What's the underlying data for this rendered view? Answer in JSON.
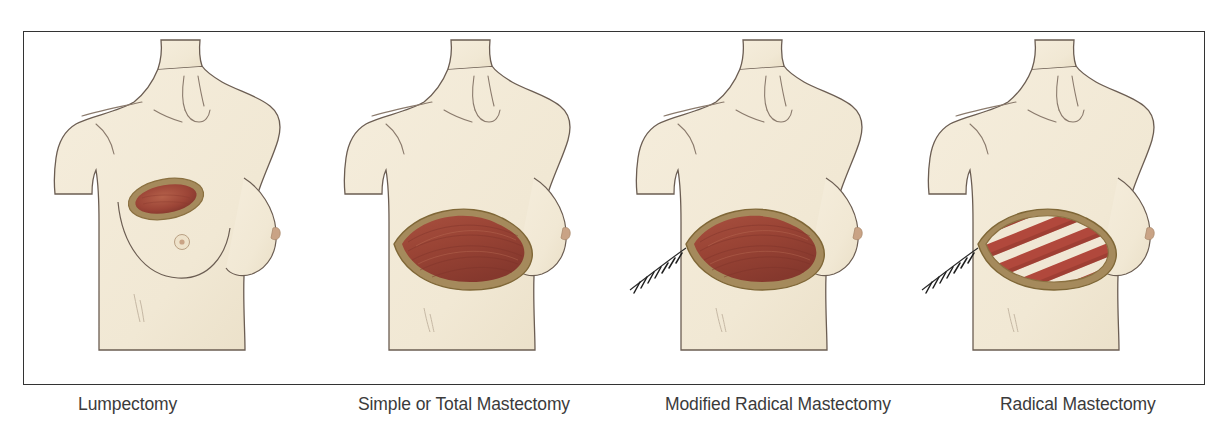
{
  "figure": {
    "border_color": "#333333",
    "background_color": "#ffffff",
    "panel_count": 4
  },
  "palette": {
    "skin_fill": "#f3ebd9",
    "skin_fill_shade": "#ece3cd",
    "outline": "#6b5d52",
    "outline_soft": "#9c8e80",
    "nipple": "#c9a385",
    "wound_rim": "#a58a5c",
    "wound_rim_dark": "#8a7040",
    "muscle_dark": "#8e3f33",
    "muscle_mid": "#a8503f",
    "muscle_light": "#bb6a52",
    "rib_red": "#b1493c",
    "rib_gap": "#f0e7d5",
    "suture_line": "#2b2b2b",
    "caption_text": "#3b3b3b"
  },
  "panels": [
    {
      "id": "lumpectomy",
      "caption": "Lumpectomy",
      "description": "Female torso, both breasts intact, small elliptical incision on left breast",
      "breast_left_present": true,
      "breast_right_present": true,
      "wound_shape": "small-ellipse",
      "wound_contents": "tumor-cavity",
      "suture_line": false,
      "ribs_visible": false
    },
    {
      "id": "simple-total-mastectomy",
      "caption": "Simple or Total Mastectomy",
      "description": "Left breast removed, large lens-shaped open wound exposing chest muscle",
      "breast_left_present": false,
      "breast_right_present": true,
      "wound_shape": "large-lens",
      "wound_contents": "pectoral-muscle",
      "suture_line": false,
      "ribs_visible": false
    },
    {
      "id": "modified-radical-mastectomy",
      "caption": "Modified Radical Mastectomy",
      "description": "Left breast removed with muscle exposed plus sutured incision extending toward the axilla",
      "breast_left_present": false,
      "breast_right_present": true,
      "wound_shape": "large-lens",
      "wound_contents": "pectoral-muscle",
      "suture_line": true,
      "ribs_visible": false
    },
    {
      "id": "radical-mastectomy",
      "caption": "Radical Mastectomy",
      "description": "Left breast and chest muscle removed, exposing ribs as diagonal red and cream bands, with sutured axillary incision",
      "breast_left_present": false,
      "breast_right_present": true,
      "wound_shape": "large-lens",
      "wound_contents": "ribs",
      "rib_band_count": 5,
      "suture_line": true,
      "ribs_visible": true
    }
  ]
}
